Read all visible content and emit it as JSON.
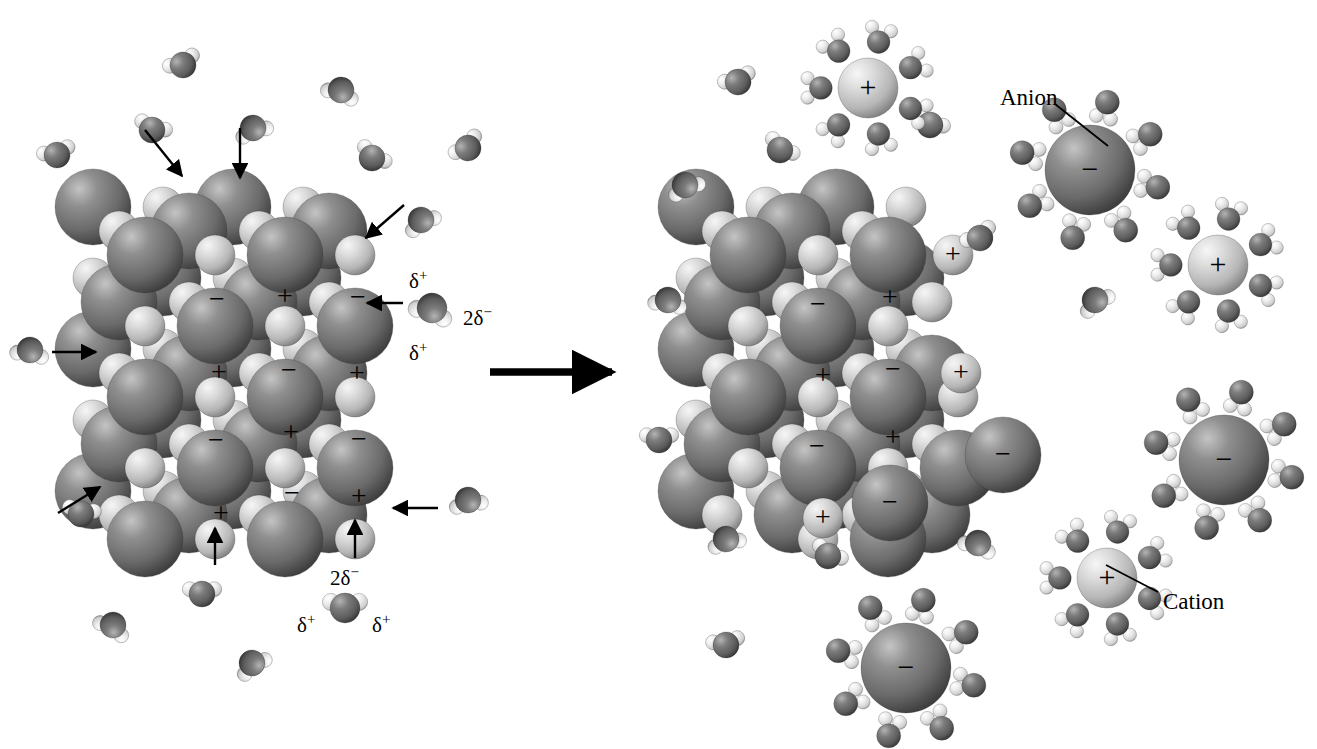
{
  "figure": {
    "type": "molecular-diagram",
    "background_color": "#ffffff",
    "process_arrow": {
      "name": "reaction-arrow",
      "direction": "right",
      "x": 490,
      "y": 372,
      "length": 128
    }
  },
  "palette": {
    "anion_dark": "#6e6e6e",
    "anion_dark_highlight": "#b9b9b9",
    "anion_dark_shadow": "#3c3c3c",
    "cation_light": "#c9c9c9",
    "cation_light_highlight": "#f2f2f2",
    "cation_light_shadow": "#7a7a7a",
    "water_oxygen": "#606060",
    "water_oxygen_highlight": "#a8a8a8",
    "water_hydrogen": "#e8e8e8",
    "water_hydrogen_highlight": "#ffffff",
    "ink": "#000000"
  },
  "labels": {
    "anion": "Anion",
    "cation": "Cation",
    "delta_positive": "δ",
    "delta_positive_sign": "+",
    "delta_negative": "2δ",
    "delta_negative_sign": "−",
    "ion_positive": "+",
    "ion_negative": "−"
  },
  "callouts": [
    {
      "name": "anion-callout",
      "text": "Anion",
      "text_x": 1000,
      "text_y": 86,
      "line_x1": 1055,
      "line_y1": 104,
      "line_x2": 1108,
      "line_y2": 146
    },
    {
      "name": "cation-callout",
      "text": "Cation",
      "text_x": 1163,
      "text_y": 590,
      "line_x1": 1158,
      "line_y1": 592,
      "line_x2": 1106,
      "line_y2": 565
    }
  ],
  "water_label_groups": [
    {
      "name": "water-polarity-label-right",
      "molecule_x": 432,
      "molecule_y": 308,
      "parts": [
        {
          "name": "delta-plus-top",
          "text": "δ",
          "sign": "+",
          "x": 409,
          "y": 268
        },
        {
          "name": "delta-2minus",
          "text": "2δ",
          "sign": "−",
          "x": 463,
          "y": 305
        },
        {
          "name": "delta-plus-bottom",
          "text": "δ",
          "sign": "+",
          "x": 409,
          "y": 340
        }
      ]
    },
    {
      "name": "water-polarity-label-bottom",
      "molecule_x": 345,
      "molecule_y": 608,
      "parts": [
        {
          "name": "delta-2minus-top",
          "text": "2δ",
          "sign": "−",
          "x": 330,
          "y": 565
        },
        {
          "name": "delta-plus-left",
          "text": "δ",
          "sign": "+",
          "x": 297,
          "y": 612
        },
        {
          "name": "delta-plus-right",
          "text": "δ",
          "sign": "+",
          "x": 372,
          "y": 612
        }
      ]
    }
  ],
  "crystals": [
    {
      "name": "intact-crystal",
      "side": "left",
      "center_x": 235,
      "center_y": 375,
      "description": "Intact ionic lattice being attacked by water molecules",
      "visible_ion_labels": [
        {
          "sign": "−",
          "x": 217,
          "y": 300
        },
        {
          "sign": "+",
          "x": 285,
          "y": 297
        },
        {
          "sign": "−",
          "x": 358,
          "y": 298
        },
        {
          "sign": "+",
          "x": 219,
          "y": 373
        },
        {
          "sign": "−",
          "x": 289,
          "y": 371
        },
        {
          "sign": "+",
          "x": 357,
          "y": 374
        },
        {
          "sign": "−",
          "x": 216,
          "y": 441
        },
        {
          "sign": "+",
          "x": 291,
          "y": 433
        },
        {
          "sign": "−",
          "x": 359,
          "y": 440
        },
        {
          "sign": "+",
          "x": 221,
          "y": 514
        },
        {
          "sign": "−",
          "x": 292,
          "y": 494
        },
        {
          "sign": "+",
          "x": 359,
          "y": 497
        }
      ]
    },
    {
      "name": "dissolving-crystal",
      "side": "right",
      "center_x": 835,
      "center_y": 375,
      "description": "Partially dissolved lattice with ions detaching at the edges",
      "visible_ion_labels": [
        {
          "sign": "−",
          "x": 818,
          "y": 305
        },
        {
          "sign": "+",
          "x": 890,
          "y": 298
        },
        {
          "sign": "+",
          "x": 953,
          "y": 255
        },
        {
          "sign": "+",
          "x": 823,
          "y": 376
        },
        {
          "sign": "−",
          "x": 893,
          "y": 370
        },
        {
          "sign": "+",
          "x": 961,
          "y": 373
        },
        {
          "sign": "−",
          "x": 817,
          "y": 447
        },
        {
          "sign": "+",
          "x": 893,
          "y": 438
        },
        {
          "sign": "−",
          "x": 1003,
          "y": 455
        },
        {
          "sign": "−",
          "x": 890,
          "y": 503
        },
        {
          "sign": "+",
          "x": 823,
          "y": 518
        }
      ]
    }
  ],
  "attack_arrows": [
    {
      "name": "attack-arrow-top-left",
      "x1": 145,
      "y1": 130,
      "x2": 182,
      "y2": 176
    },
    {
      "name": "attack-arrow-top-mid",
      "x1": 240,
      "y1": 128,
      "x2": 240,
      "y2": 178
    },
    {
      "name": "attack-arrow-top-right",
      "x1": 404,
      "y1": 205,
      "x2": 366,
      "y2": 238
    },
    {
      "name": "attack-arrow-right-mid",
      "x1": 403,
      "y1": 303,
      "x2": 367,
      "y2": 303
    },
    {
      "name": "attack-arrow-left-upper",
      "x1": 52,
      "y1": 352,
      "x2": 96,
      "y2": 352
    },
    {
      "name": "attack-arrow-left-lower",
      "x1": 58,
      "y1": 513,
      "x2": 100,
      "y2": 487
    },
    {
      "name": "attack-arrow-right-low",
      "x1": 438,
      "y1": 508,
      "x2": 393,
      "y2": 508
    },
    {
      "name": "attack-arrow-bottom-left",
      "x1": 215,
      "y1": 565,
      "x2": 215,
      "y2": 528
    },
    {
      "name": "attack-arrow-bottom-right",
      "x1": 355,
      "y1": 558,
      "x2": 355,
      "y2": 520
    }
  ],
  "hydrated_ions": [
    {
      "name": "hydrated-cation-top",
      "sign": "+",
      "x": 868,
      "y": 88,
      "r": 30,
      "waters": 7
    },
    {
      "name": "hydrated-anion-top",
      "sign": "−",
      "x": 1090,
      "y": 170,
      "r": 45,
      "waters": 8
    },
    {
      "name": "hydrated-cation-right",
      "sign": "+",
      "x": 1218,
      "y": 265,
      "r": 30,
      "waters": 7
    },
    {
      "name": "hydrated-anion-right",
      "sign": "−",
      "x": 1224,
      "y": 460,
      "r": 45,
      "waters": 8
    },
    {
      "name": "hydrated-cation-bottom",
      "sign": "+",
      "x": 1107,
      "y": 578,
      "r": 30,
      "waters": 7
    },
    {
      "name": "hydrated-anion-bottom",
      "sign": "−",
      "x": 906,
      "y": 668,
      "r": 45,
      "waters": 8
    }
  ],
  "free_water_molecules": {
    "left_panel": [
      {
        "x": 183,
        "y": 65,
        "rot": -25
      },
      {
        "x": 253,
        "y": 128,
        "rot": 160
      },
      {
        "x": 152,
        "y": 130,
        "rot": 20
      },
      {
        "x": 57,
        "y": 155,
        "rot": -15
      },
      {
        "x": 341,
        "y": 90,
        "rot": 200
      },
      {
        "x": 372,
        "y": 158,
        "rot": 35
      },
      {
        "x": 468,
        "y": 148,
        "rot": -40
      },
      {
        "x": 421,
        "y": 220,
        "rot": 150
      },
      {
        "x": 30,
        "y": 350,
        "rot": 190
      },
      {
        "x": 81,
        "y": 514,
        "rot": 10
      },
      {
        "x": 468,
        "y": 500,
        "rot": 170
      },
      {
        "x": 202,
        "y": 594,
        "rot": 0
      },
      {
        "x": 113,
        "y": 625,
        "rot": 210
      },
      {
        "x": 252,
        "y": 663,
        "rot": 145
      }
    ],
    "right_panel": [
      {
        "x": 738,
        "y": 82,
        "rot": -20
      },
      {
        "x": 780,
        "y": 150,
        "rot": 35
      },
      {
        "x": 685,
        "y": 185,
        "rot": 155
      },
      {
        "x": 930,
        "y": 125,
        "rot": 25
      },
      {
        "x": 980,
        "y": 238,
        "rot": -30
      },
      {
        "x": 668,
        "y": 300,
        "rot": 190
      },
      {
        "x": 1095,
        "y": 300,
        "rot": 145
      },
      {
        "x": 659,
        "y": 440,
        "rot": 0
      },
      {
        "x": 726,
        "y": 539,
        "rot": 165
      },
      {
        "x": 828,
        "y": 556,
        "rot": 30
      },
      {
        "x": 978,
        "y": 543,
        "rot": 200
      },
      {
        "x": 726,
        "y": 645,
        "rot": -10
      }
    ]
  }
}
